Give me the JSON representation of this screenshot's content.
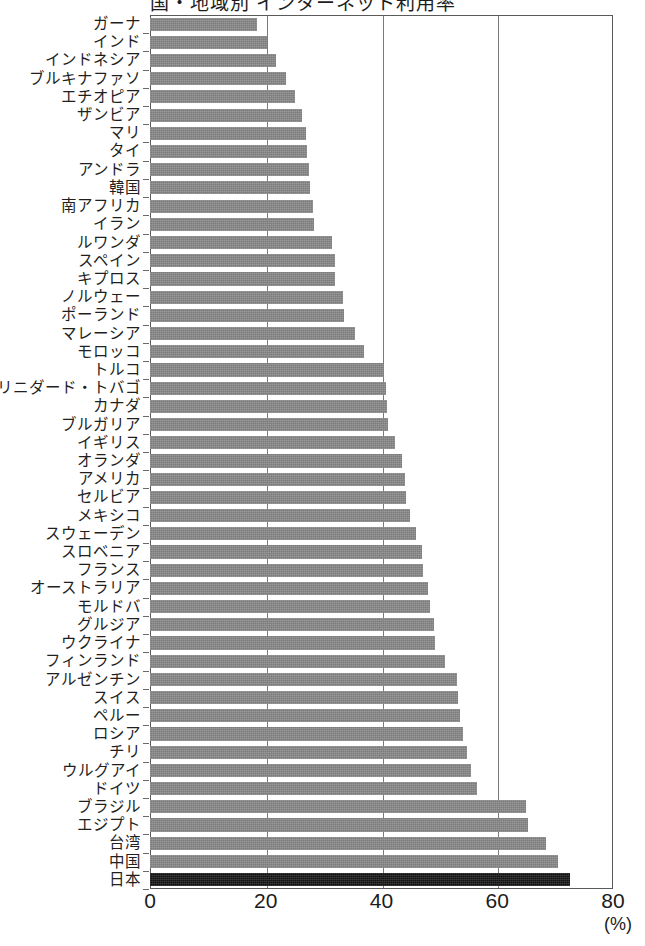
{
  "chart": {
    "title_partial": "国・地域別 インターネット利用率",
    "unit_label": "(%)"
  },
  "axis": {
    "ticks": [
      "0",
      "20",
      "40",
      "60",
      "80"
    ]
  },
  "chart_data": {
    "type": "bar",
    "orientation": "horizontal",
    "title": "国・地域別 インターネット利用率",
    "xlabel": "(%)",
    "ylabel": "",
    "xlim": [
      0,
      80
    ],
    "grid": true,
    "gridlines": [
      20,
      40,
      60
    ],
    "legend": "none",
    "highlight_category": "日本",
    "highlight_color": "#111111",
    "bar_color": "#7b7b7b",
    "categories": [
      "ガーナ",
      "インド",
      "インドネシア",
      "ブルキナファソ",
      "エチオピア",
      "ザンビア",
      "マリ",
      "タイ",
      "アンドラ",
      "韓国",
      "南アフリカ",
      "イラン",
      "ルワンダ",
      "スペイン",
      "キプロス",
      "ノルウェー",
      "ポーランド",
      "マレーシア",
      "モロッコ",
      "トルコ",
      "トリニダード・トバゴ",
      "カナダ",
      "ブルガリア",
      "イギリス",
      "オランダ",
      "アメリカ",
      "セルビア",
      "メキシコ",
      "スウェーデン",
      "スロベニア",
      "フランス",
      "オーストラリア",
      "モルドバ",
      "グルジア",
      "ウクライナ",
      "フィンランド",
      "アルゼンチン",
      "スイス",
      "ペルー",
      "ロシア",
      "チリ",
      "ウルグアイ",
      "ドイツ",
      "ブラジル",
      "エジプト",
      "台湾",
      "中国",
      "日本"
    ],
    "values": [
      18.5,
      20.3,
      21.7,
      23.5,
      25.0,
      26.3,
      27.0,
      27.2,
      27.5,
      27.7,
      28.2,
      28.3,
      31.5,
      32.0,
      32.0,
      33.3,
      33.5,
      35.5,
      37.0,
      40.5,
      40.8,
      41.0,
      41.2,
      42.3,
      43.5,
      44.0,
      44.3,
      45.0,
      46.0,
      47.0,
      47.2,
      48.0,
      48.3,
      49.0,
      49.2,
      51.0,
      53.0,
      53.3,
      53.5,
      54.0,
      54.8,
      55.5,
      56.5,
      65.0,
      65.3,
      68.5,
      70.5,
      72.5
    ]
  }
}
